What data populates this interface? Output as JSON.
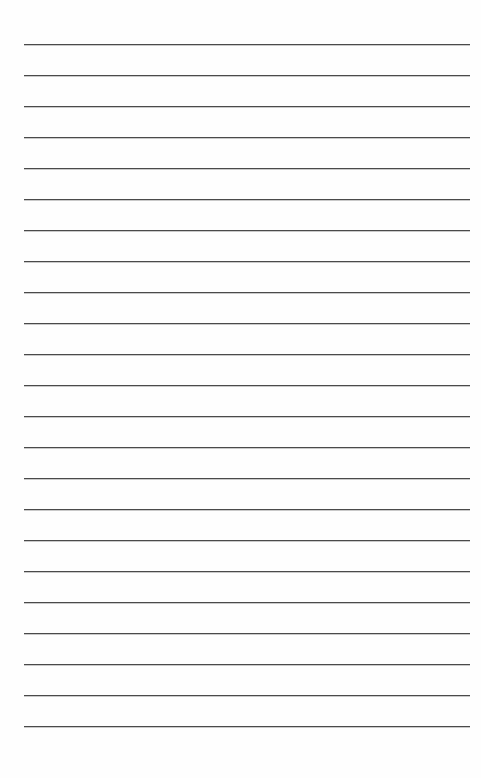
{
  "page": {
    "kind": "ruled-notebook-paper",
    "title": "",
    "width": 481,
    "height": 778,
    "background_color": "#fefefe",
    "written_text": ""
  },
  "ruling": {
    "line_color": "#4a4a4a",
    "line_thickness_px": 1,
    "line_count": 23,
    "first_line_y": 44,
    "line_spacing_px": 31,
    "line_start_x": 24,
    "line_end_x": 470,
    "top_margin_px": 44,
    "bottom_margin_px": 52,
    "left_margin_px": 24,
    "right_margin_px": 11,
    "vertical_margin_rule": false,
    "line_y_positions": [
      44,
      75,
      106,
      137,
      168,
      199,
      230,
      261,
      292,
      323,
      354,
      385,
      416,
      447,
      478,
      509,
      540,
      571,
      602,
      633,
      664,
      695,
      726
    ]
  }
}
